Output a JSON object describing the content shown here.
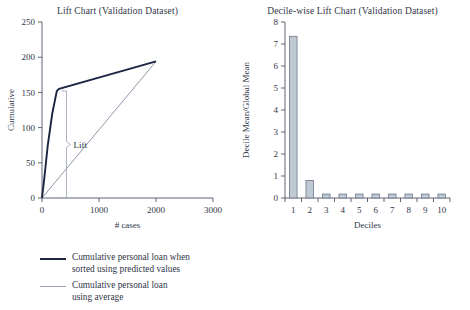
{
  "figure": {
    "background": "#ffffff",
    "text_color": "#2f3648"
  },
  "left_chart": {
    "title": "Lift Chart (Validation Dataset)",
    "annotation": "Lift"
  },
  "right_chart": {
    "title": "Decile-wise Lift Chart (Validation Dataset)"
  },
  "legend": {
    "items": [
      {
        "label": "Cumulative personal loan when\nsorted using predicted values",
        "color": "#1c2541",
        "style": "thick-line"
      },
      {
        "label": "Cumulative personal loan\nusing average",
        "color": "#99a2b3",
        "style": "thin-line"
      }
    ]
  },
  "chart_data": [
    {
      "type": "line",
      "title": "Lift Chart (Validation Dataset)",
      "xlabel": "# cases",
      "ylabel": "Cumulative",
      "xlim": [
        0,
        3000
      ],
      "ylim": [
        0,
        250
      ],
      "xticks": [
        0,
        1000,
        2000,
        3000
      ],
      "yticks": [
        0,
        50,
        100,
        150,
        200,
        250
      ],
      "grid": false,
      "legend_position": "below-figure",
      "annotations": [
        {
          "text": "Lift",
          "x": 520,
          "y": 72,
          "type": "brace-label"
        }
      ],
      "series": [
        {
          "name": "Cumulative personal loan when sorted using predicted values",
          "color": "#1c2541",
          "x": [
            0,
            40,
            100,
            180,
            260,
            300,
            2000
          ],
          "y": [
            0,
            28,
            74,
            120,
            152,
            155,
            194
          ]
        },
        {
          "name": "Cumulative personal loan using average",
          "color": "#8d96a8",
          "x": [
            0,
            2000
          ],
          "y": [
            0,
            194
          ]
        }
      ]
    },
    {
      "type": "bar",
      "title": "Decile-wise Lift Chart (Validation Dataset)",
      "xlabel": "Deciles",
      "ylabel": "Decile Mean/Global Mean",
      "xlim": [
        0.5,
        10.5
      ],
      "ylim": [
        0,
        8
      ],
      "yticks": [
        0,
        1,
        2,
        3,
        4,
        5,
        6,
        7,
        8
      ],
      "grid": false,
      "bar_color": "#bfc9d4",
      "bar_edge_color": "#6c7787",
      "categories": [
        "1",
        "2",
        "3",
        "4",
        "5",
        "6",
        "7",
        "8",
        "9",
        "10"
      ],
      "values": [
        7.35,
        0.8,
        0.18,
        0.18,
        0.18,
        0.18,
        0.18,
        0.18,
        0.18,
        0.18
      ]
    }
  ]
}
